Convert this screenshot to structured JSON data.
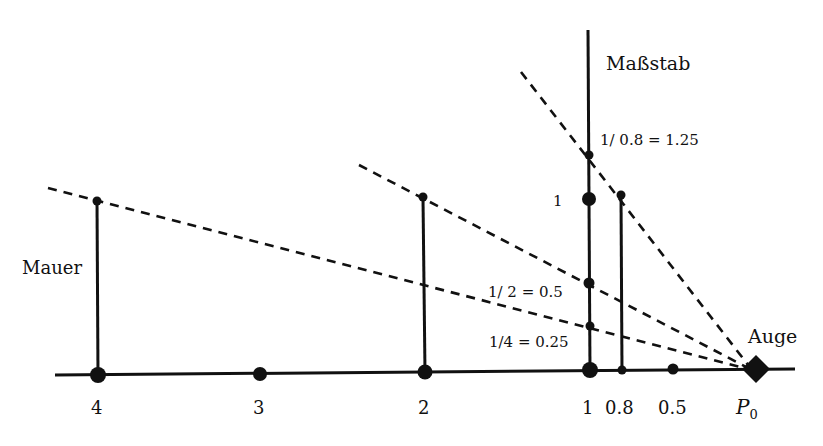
{
  "labels": {
    "measuring_stick": "Maßstab",
    "wall": "Mauer",
    "eye": "Auge",
    "eye_point": "P",
    "eye_point_sub": "0",
    "stick_125": "1/ 0.8 = 1.25",
    "stick_1": "1",
    "stick_05": "1/ 2 = 0.5",
    "stick_025": "1/4 = 0.25"
  },
  "axis_ticks": [
    "4",
    "3",
    "2",
    "1",
    "0.8",
    "0.5"
  ],
  "colors": {
    "stroke": "#111111",
    "background": "#ffffff"
  }
}
